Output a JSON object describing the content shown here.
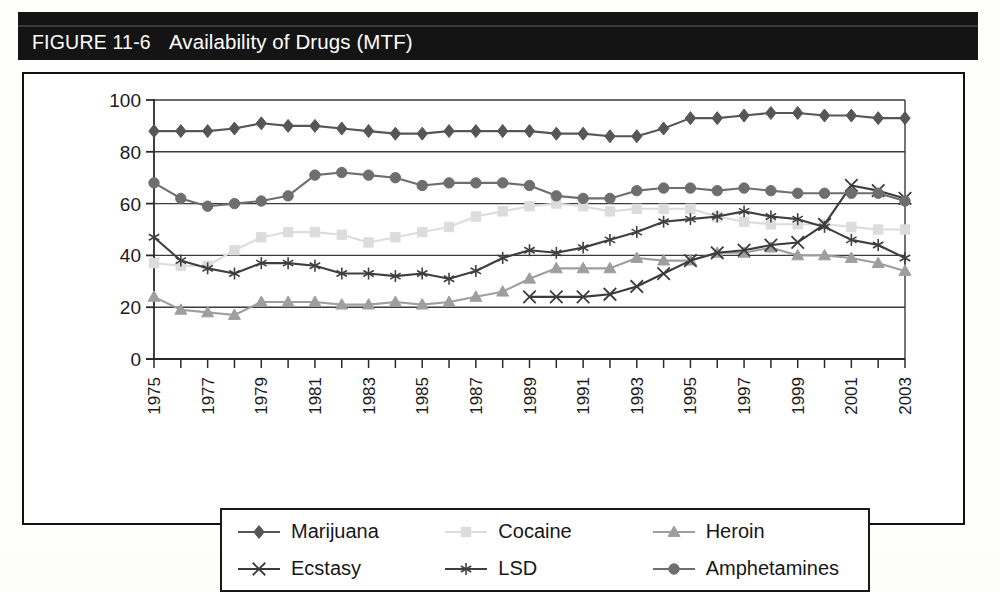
{
  "figure": {
    "number": "FIGURE 11-6",
    "title": "Availability of Drugs (MTF)"
  },
  "colors": {
    "marijuana": "#565656",
    "cocaine": "#dcdcdc",
    "heroin": "#9e9e9e",
    "ecstasy": "#3b3b3b",
    "lsd": "#3f3f3f",
    "amphetamines": "#6e6e6e",
    "axis": "#2a2a2a",
    "grid": "#3a3a3a",
    "band": "#141414",
    "band_text": "#ffffff"
  },
  "legend": {
    "items": [
      {
        "label": "Marijuana",
        "marker": "diamond",
        "color": "#565656"
      },
      {
        "label": "Cocaine",
        "marker": "square",
        "color": "#dcdcdc"
      },
      {
        "label": "Heroin",
        "marker": "triangle",
        "color": "#9e9e9e"
      },
      {
        "label": "Ecstasy",
        "marker": "cross",
        "color": "#3b3b3b"
      },
      {
        "label": "LSD",
        "marker": "asterisk",
        "color": "#3f3f3f"
      },
      {
        "label": "Amphetamines",
        "marker": "circle",
        "color": "#6e6e6e"
      }
    ]
  },
  "chart_data": {
    "type": "line",
    "title": "Availability of Drugs (MTF)",
    "xlabel": "",
    "ylabel": "",
    "ylim": [
      0,
      100
    ],
    "yticks": [
      0,
      20,
      40,
      60,
      80,
      100
    ],
    "grid": true,
    "grid_axis": "y",
    "legend_position": "bottom",
    "x": [
      1975,
      1976,
      1977,
      1978,
      1979,
      1980,
      1981,
      1982,
      1983,
      1984,
      1985,
      1986,
      1987,
      1988,
      1989,
      1990,
      1991,
      1992,
      1993,
      1994,
      1995,
      1996,
      1997,
      1998,
      1999,
      2000,
      2001,
      2002,
      2003
    ],
    "xtick_labels": [
      "1975",
      "",
      "1977",
      "",
      "1979",
      "",
      "1981",
      "",
      "1983",
      "",
      "1985",
      "",
      "1987",
      "",
      "1989",
      "",
      "1991",
      "",
      "1993",
      "",
      "1995",
      "",
      "1997",
      "",
      "1999",
      "",
      "2001",
      "",
      "2003"
    ],
    "series": [
      {
        "name": "Marijuana",
        "marker": "diamond",
        "color": "#565656",
        "values": [
          88,
          88,
          88,
          89,
          91,
          90,
          90,
          89,
          88,
          87,
          87,
          88,
          88,
          88,
          88,
          87,
          87,
          86,
          86,
          89,
          93,
          93,
          94,
          95,
          95,
          94,
          94,
          93,
          93
        ]
      },
      {
        "name": "Cocaine",
        "marker": "square",
        "color": "#dcdcdc",
        "values": [
          37,
          36,
          36,
          42,
          47,
          49,
          49,
          48,
          45,
          47,
          49,
          51,
          55,
          57,
          59,
          60,
          59,
          57,
          58,
          58,
          58,
          55,
          53,
          52,
          52,
          52,
          51,
          50,
          50
        ]
      },
      {
        "name": "Heroin",
        "marker": "triangle",
        "color": "#9e9e9e",
        "values": [
          24,
          19,
          18,
          17,
          22,
          22,
          22,
          21,
          21,
          22,
          21,
          22,
          24,
          26,
          31,
          35,
          35,
          35,
          39,
          38,
          38,
          41,
          41,
          43,
          40,
          40,
          39,
          37,
          34
        ]
      },
      {
        "name": "Ecstasy",
        "marker": "cross",
        "color": "#3b3b3b",
        "values": [
          null,
          null,
          null,
          null,
          null,
          null,
          null,
          null,
          null,
          null,
          null,
          null,
          null,
          null,
          24,
          24,
          24,
          25,
          28,
          33,
          38,
          41,
          42,
          44,
          45,
          52,
          67,
          65,
          62
        ]
      },
      {
        "name": "LSD",
        "marker": "asterisk",
        "color": "#3f3f3f",
        "values": [
          47,
          38,
          35,
          33,
          37,
          37,
          36,
          33,
          33,
          32,
          33,
          31,
          34,
          39,
          42,
          41,
          43,
          46,
          49,
          53,
          54,
          55,
          57,
          55,
          54,
          51,
          46,
          44,
          39
        ]
      },
      {
        "name": "Amphetamines",
        "marker": "circle",
        "color": "#6e6e6e",
        "values": [
          68,
          62,
          59,
          60,
          61,
          63,
          71,
          72,
          71,
          70,
          67,
          68,
          68,
          68,
          67,
          63,
          62,
          62,
          65,
          66,
          66,
          65,
          66,
          65,
          64,
          64,
          64,
          64,
          61
        ]
      }
    ]
  }
}
